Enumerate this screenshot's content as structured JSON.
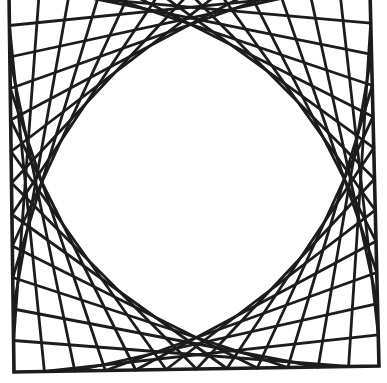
{
  "figure": {
    "background": "#ffffff",
    "stroke_color": "#1c1c1c",
    "line_width": 2.8,
    "frame_width": 3.6,
    "frame_corners": {
      "top_left": [
        9,
        -6
      ],
      "top_right": [
        370,
        -8
      ],
      "bottom_right": [
        379,
        366
      ],
      "bottom_left": [
        14,
        372
      ]
    },
    "divisions": 12,
    "families": [
      {
        "name": "top-left",
        "edge_a": "top",
        "edge_b": "left"
      },
      {
        "name": "top-right",
        "edge_a": "top",
        "edge_b": "right"
      },
      {
        "name": "bottom-left",
        "edge_a": "bottom",
        "edge_b": "left"
      },
      {
        "name": "bottom-right",
        "edge_a": "bottom",
        "edge_b": "right"
      }
    ]
  }
}
